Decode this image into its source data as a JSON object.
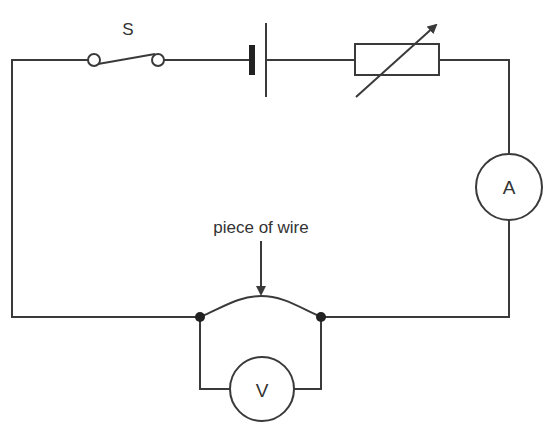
{
  "diagram": {
    "type": "circuit",
    "stroke_color": "#3a3a3a",
    "background": "#ffffff",
    "components": {
      "switch": {
        "label": "S"
      },
      "cell": {
        "label": ""
      },
      "variable_resistor": {
        "label": ""
      },
      "ammeter": {
        "label": "A"
      },
      "voltmeter": {
        "label": "V"
      },
      "wire_sample": {
        "annotation": "piece of wire"
      }
    }
  }
}
